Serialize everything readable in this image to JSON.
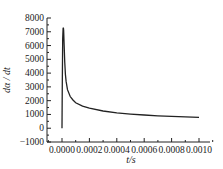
{
  "chart_data": {
    "type": "line",
    "title": "",
    "xlabel": "t/s",
    "ylabel": "dα / dt",
    "xlim": [
      0.0,
      0.001
    ],
    "ylim": [
      -1000,
      8000
    ],
    "xticks": [
      "0.0000",
      "0.0002",
      "0.0004",
      "0.0006",
      "0.0008",
      "0.0010"
    ],
    "yticks": [
      "-1000",
      "0",
      "1000",
      "2000",
      "3000",
      "4000",
      "5000",
      "6000",
      "7000",
      "8000"
    ],
    "grid": false,
    "legend": null,
    "series": [
      {
        "name": "dα/dt",
        "x": [
          0.0,
          2e-06,
          5e-06,
          8e-06,
          1e-05,
          1.2e-05,
          1.5e-05,
          2e-05,
          2.5e-05,
          3e-05,
          4e-05,
          6e-05,
          8e-05,
          0.0001,
          0.00015,
          0.0002,
          0.0003,
          0.0004,
          0.0005,
          0.0006,
          0.0007,
          0.0008,
          0.0009,
          0.001
        ],
        "y": [
          0,
          3000,
          6500,
          7250,
          7300,
          7100,
          6200,
          4800,
          3900,
          3400,
          2800,
          2300,
          2050,
          1850,
          1600,
          1450,
          1250,
          1120,
          1030,
          960,
          900,
          860,
          820,
          790
        ]
      }
    ]
  }
}
